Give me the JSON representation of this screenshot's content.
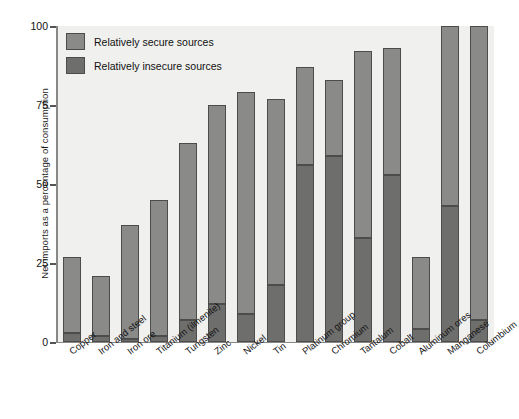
{
  "chart_data": {
    "type": "bar",
    "title": "",
    "subtitle": "",
    "xlabel": "",
    "ylabel": "Net imports as a percentage of consumption",
    "ylim": [
      0,
      100
    ],
    "yticks": [
      0,
      25,
      50,
      75,
      100
    ],
    "ytick_labels": [
      "0",
      "25",
      "50",
      "75",
      "100"
    ],
    "grid": false,
    "stacked": true,
    "legend_position": "top-left",
    "categories": [
      "Copper",
      "Iron and steel",
      "Iron ore",
      "Titanium (ilmenite)",
      "Tungsten",
      "Zinc",
      "Nickel",
      "Tin",
      "Platinum group",
      "Chromium",
      "Tantalum",
      "Cobalt",
      "Aluminum ores",
      "Manganese",
      "Columbium"
    ],
    "series": [
      {
        "name": "Relatively insecure sources",
        "color": "#6e6e6c",
        "values": [
          3,
          2,
          1,
          2,
          7,
          12,
          9,
          18,
          56,
          59,
          33,
          53,
          4,
          43,
          7
        ]
      },
      {
        "name": "Relatively secure sources",
        "color": "#8a8a88",
        "values": [
          24,
          19,
          36,
          43,
          56,
          63,
          70,
          59,
          31,
          24,
          59,
          40,
          23,
          57,
          93
        ]
      }
    ],
    "totals": [
      27,
      21,
      37,
      45,
      63,
      75,
      79,
      77,
      87,
      83,
      92,
      93,
      27,
      100,
      100
    ]
  },
  "legend": {
    "items": [
      {
        "label": "Relatively secure sources",
        "swatch": "secure"
      },
      {
        "label": "Relatively insecure sources",
        "swatch": "insecure"
      }
    ]
  },
  "colors": {
    "plot_background": "#f0f0ee",
    "secure": "#8a8a88",
    "insecure": "#6e6e6c",
    "outline": "#4c4c4c",
    "axis": "#888886",
    "text": "#111111"
  }
}
